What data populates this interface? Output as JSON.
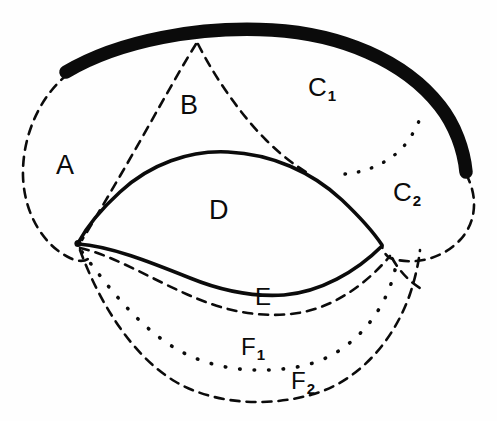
{
  "figure": {
    "kind": "anatomical-schematic-diagram",
    "background_color": "#fefefe",
    "ink_color": "#0b0b0b",
    "labels": [
      {
        "id": "A",
        "text": "A",
        "sub": "",
        "region": "region-a"
      },
      {
        "id": "B",
        "text": "B",
        "sub": "",
        "region": "region-b"
      },
      {
        "id": "C1",
        "text": "C",
        "sub": "1",
        "region": "region-c1"
      },
      {
        "id": "C2",
        "text": "C",
        "sub": "2",
        "region": "region-c2"
      },
      {
        "id": "D",
        "text": "D",
        "sub": "",
        "region": "region-d"
      },
      {
        "id": "E",
        "text": "E",
        "sub": "",
        "region": "region-e"
      },
      {
        "id": "F1",
        "text": "F",
        "sub": "1",
        "region": "region-f1"
      },
      {
        "id": "F2",
        "text": "F",
        "sub": "2",
        "region": "region-f2"
      }
    ],
    "strokes": {
      "thick_solid": {
        "name": "thick-black-arc",
        "width": 13,
        "style": "solid"
      },
      "solid": {
        "name": "solid-outline",
        "width": 3.4,
        "style": "solid"
      },
      "dashed": {
        "name": "dashed-outline",
        "width": 2.6,
        "style": "dashed",
        "pattern": "9 7"
      },
      "dotted": {
        "name": "dotted-outline",
        "width": 3.2,
        "style": "dotted",
        "pattern": "1 12"
      }
    }
  }
}
